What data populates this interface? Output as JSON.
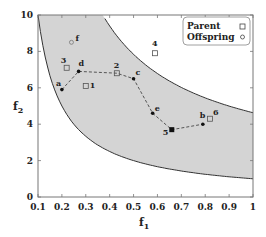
{
  "chart_data": {
    "type": "scatter",
    "title": "",
    "xlabel": "f1",
    "ylabel": "f2",
    "xlim": [
      0.1,
      1.0
    ],
    "ylim": [
      0,
      10
    ],
    "x_ticks": [
      "0.1",
      "0.2",
      "0.3",
      "0.4",
      "0.5",
      "0.6",
      "0.7",
      "0.8",
      "0.9",
      "1"
    ],
    "y_ticks": [
      "0",
      "2",
      "4",
      "6",
      "8",
      "10"
    ],
    "grid": false,
    "legend_position": "upper right",
    "legend": [
      {
        "label": "Parent",
        "marker": "square-open"
      },
      {
        "label": "Offspring",
        "marker": "circle-open"
      }
    ],
    "feasible_region": {
      "fill": "#d4d4d4",
      "lower_boundary": "f2 = 1/f1",
      "upper_boundary": "f2 = (1 + 10)/f1 approx, concave upper-left curve",
      "note": "shaded region between two convex curves"
    },
    "series": [
      {
        "name": "Parent",
        "marker": "square",
        "points": [
          {
            "label": "1",
            "x": 0.3,
            "y": 6.1,
            "filled": false
          },
          {
            "label": "2",
            "x": 0.43,
            "y": 6.8,
            "filled": false
          },
          {
            "label": "3",
            "x": 0.22,
            "y": 7.1,
            "filled": false
          },
          {
            "label": "4",
            "x": 0.59,
            "y": 7.9,
            "filled": false
          },
          {
            "label": "5",
            "x": 0.66,
            "y": 3.7,
            "filled": true
          },
          {
            "label": "6",
            "x": 0.82,
            "y": 4.3,
            "filled": false
          }
        ]
      },
      {
        "name": "Offspring",
        "marker": "circle",
        "points": [
          {
            "label": "a",
            "x": 0.2,
            "y": 5.9,
            "filled": true
          },
          {
            "label": "b",
            "x": 0.79,
            "y": 4.0,
            "filled": true
          },
          {
            "label": "c",
            "x": 0.5,
            "y": 6.5,
            "filled": true
          },
          {
            "label": "d",
            "x": 0.27,
            "y": 6.9,
            "filled": true
          },
          {
            "label": "e",
            "x": 0.58,
            "y": 4.6,
            "filled": true
          },
          {
            "label": "f",
            "x": 0.24,
            "y": 8.5,
            "filled": false
          }
        ]
      }
    ],
    "dashed_path": [
      "a",
      "d",
      "2",
      "c",
      "e",
      "5",
      "b"
    ],
    "colors": {
      "region": "#d4d4d4",
      "axis": "#555555",
      "curve": "#333333",
      "marker": "#111111"
    }
  },
  "labels": {
    "xlabel": "f",
    "xlabel_sub": "1",
    "ylabel": "f",
    "ylabel_sub": "2",
    "legend_parent": "Parent",
    "legend_offspring": "Offspring"
  }
}
